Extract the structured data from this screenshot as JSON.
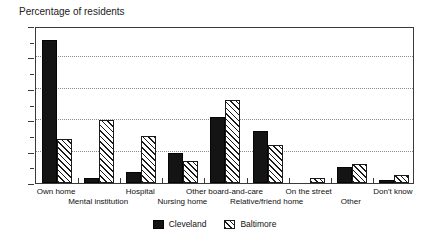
{
  "chart_data": {
    "type": "bar",
    "title": "Percentage of residents",
    "xlabel": "",
    "ylabel": "Percentage of residents",
    "ylim": [
      0,
      50
    ],
    "ytick_step": 10,
    "yminor_step": 5,
    "ytick_labels": [
      "0",
      "10",
      "20",
      "30",
      "40",
      "50"
    ],
    "grid": "horizontal dotted at 10, 20, 30, 40",
    "legend_position": "bottom-center",
    "categories": [
      "Own home",
      "Mental institution",
      "Hospital",
      "Nursing home",
      "Other board-and-care",
      "Relative/friend home",
      "On the street",
      "Other",
      "Don't know"
    ],
    "series": [
      {
        "name": "Cleveland",
        "color": "#141414",
        "fill": "solid-black",
        "values": [
          45.5,
          1.5,
          3.5,
          9.5,
          21,
          16.5,
          0,
          5,
          1
        ]
      },
      {
        "name": "Baltimore",
        "color": "#1a1a1a",
        "fill": "diagonal-hatch",
        "values": [
          14,
          20,
          15,
          7,
          26.5,
          12,
          1.5,
          6,
          2.5
        ]
      }
    ]
  }
}
